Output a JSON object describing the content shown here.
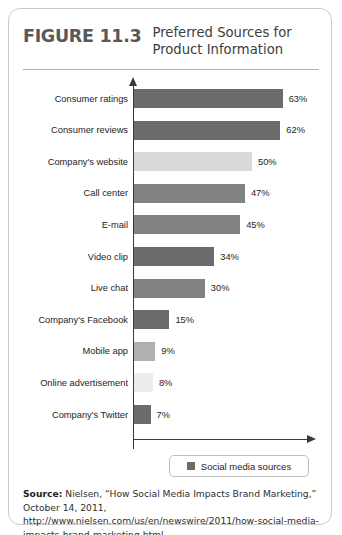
{
  "figure": {
    "number": "FIGURE 11.3",
    "title_line1": "Preferred Sources for",
    "title_line2": "Product Information"
  },
  "legend": {
    "label": "Social media sources",
    "swatch_color": "#6b6b6b"
  },
  "source": {
    "label": "Source:",
    "text": " Nielsen, “How Social Media Impacts Brand Marketing,” October 14, 2011, http://www.nielsen.com/us/en/newswire/2011/how-social-media-impacts-brand-marketing.html."
  },
  "chart_data": {
    "type": "bar",
    "orientation": "horizontal",
    "title": "Preferred Sources for Product Information",
    "xlabel": "",
    "ylabel": "",
    "xlim": [
      0,
      70
    ],
    "grid": false,
    "legend_position": "bottom",
    "categories": [
      "Consumer ratings",
      "Consumer reviews",
      "Company's website",
      "Call center",
      "E-mail",
      "Video clip",
      "Live chat",
      "Company's Facebook",
      "Mobile app",
      "Online advertisement",
      "Company's Twitter"
    ],
    "values": [
      63,
      62,
      50,
      47,
      45,
      34,
      30,
      15,
      9,
      8,
      7
    ],
    "value_labels": [
      "63%",
      "62%",
      "50%",
      "47%",
      "45%",
      "34%",
      "30%",
      "15%",
      "9%",
      "8%",
      "7%"
    ],
    "social_media": [
      true,
      true,
      false,
      false,
      false,
      true,
      false,
      true,
      false,
      false,
      true
    ],
    "bar_colors": [
      "#6b6b6b",
      "#6b6b6b",
      "#d9d9d9",
      "#828282",
      "#828282",
      "#6b6b6b",
      "#828282",
      "#6b6b6b",
      "#b0b0b0",
      "#ededed",
      "#6b6b6b"
    ]
  }
}
